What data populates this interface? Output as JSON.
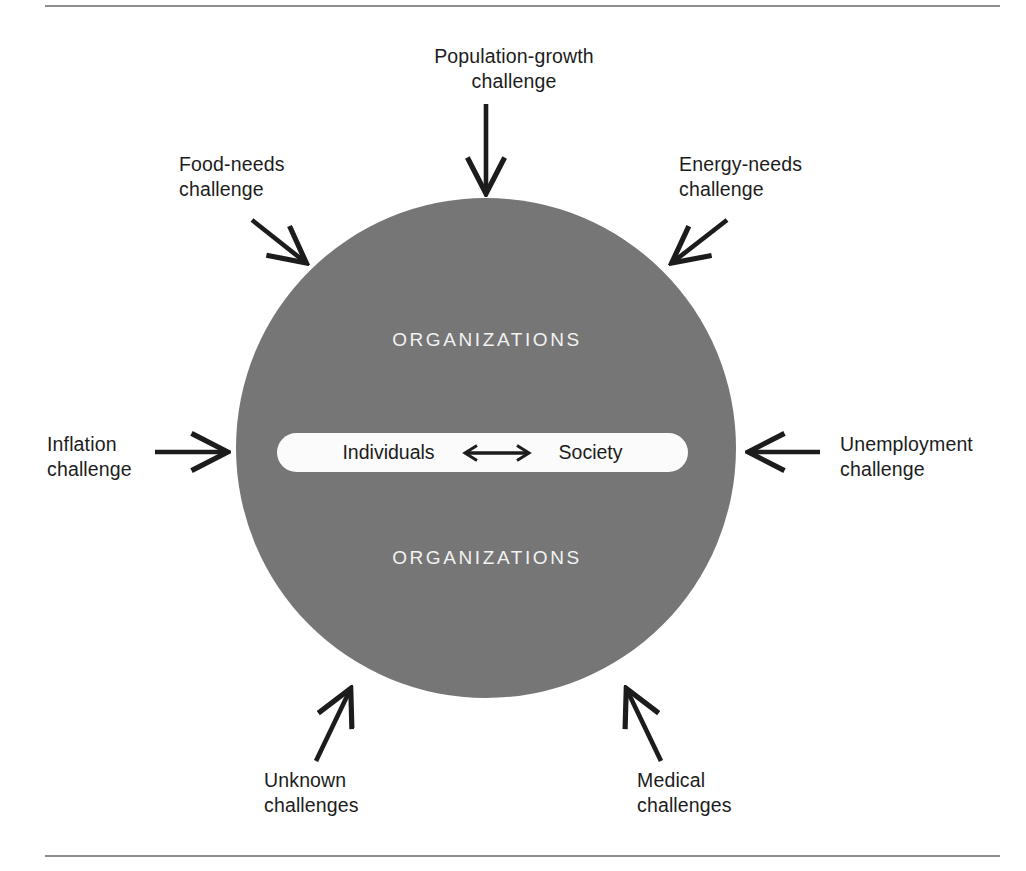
{
  "figure": {
    "type": "conceptual-diagram",
    "rules": {
      "top": "horizontal-rule",
      "bottom": "horizontal-rule"
    },
    "colors": {
      "circle_fill": "#787878",
      "core_pill_fill": "#fbfbfb",
      "label_text": "#1c1c1c",
      "organizations_text": "#f2f2f2",
      "arrow": "#1c1c1c",
      "rule": "#8e8e8e",
      "background": "#ffffff"
    }
  },
  "core": {
    "left_label": "Individuals",
    "right_label": "Society",
    "connector_icon": "double-headed-arrow-icon"
  },
  "circle": {
    "upper_band_label": "ORGANIZATIONS",
    "lower_band_label": "ORGANIZATIONS"
  },
  "challenges": [
    {
      "id": "population-growth",
      "label": "Population-growth\nchallenge",
      "arrow_icon": "arrow-down-icon",
      "position": "top"
    },
    {
      "id": "food-needs",
      "label": "Food-needs\nchallenge",
      "arrow_icon": "arrow-down-right-icon",
      "position": "top-left"
    },
    {
      "id": "energy-needs",
      "label": "Energy-needs\nchallenge",
      "arrow_icon": "arrow-down-left-icon",
      "position": "top-right"
    },
    {
      "id": "inflation",
      "label": "Inflation\nchallenge",
      "arrow_icon": "arrow-right-icon",
      "position": "left"
    },
    {
      "id": "unemployment",
      "label": "Unemployment\nchallenge",
      "arrow_icon": "arrow-left-icon",
      "position": "right"
    },
    {
      "id": "unknown",
      "label": "Unknown\nchallenges",
      "arrow_icon": "arrow-up-right-icon",
      "position": "bottom-left"
    },
    {
      "id": "medical",
      "label": "Medical\nchallenges",
      "arrow_icon": "arrow-up-left-icon",
      "position": "bottom-right"
    }
  ]
}
